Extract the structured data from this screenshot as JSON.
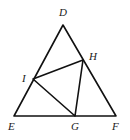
{
  "diagram": {
    "type": "geometry",
    "points": {
      "D": {
        "label": "D",
        "x": 63,
        "y": 25
      },
      "E": {
        "label": "E",
        "x": 14,
        "y": 116
      },
      "F": {
        "label": "F",
        "x": 116,
        "y": 116
      },
      "G": {
        "label": "G",
        "x": 75,
        "y": 116
      },
      "H": {
        "label": "H",
        "x": 83,
        "y": 60
      },
      "I": {
        "label": "I",
        "x": 33,
        "y": 79
      }
    },
    "segments": [
      [
        "D",
        "E"
      ],
      [
        "D",
        "F"
      ],
      [
        "E",
        "F"
      ],
      [
        "I",
        "H"
      ],
      [
        "H",
        "G"
      ],
      [
        "G",
        "I"
      ]
    ]
  }
}
